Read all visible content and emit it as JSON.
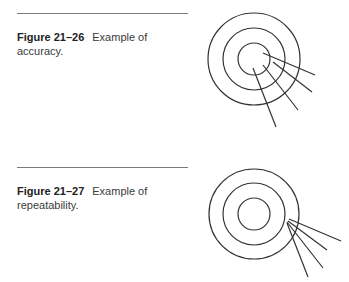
{
  "figures": [
    {
      "number": "Figure 21–26",
      "caption": "Example of accuracy.",
      "illustration": "target-accuracy",
      "target": {
        "cx": 254,
        "cy": 59,
        "radii": [
          46,
          31,
          16
        ]
      },
      "arrows": [
        {
          "x1": 263,
          "y1": 53,
          "x2": 315,
          "y2": 75
        },
        {
          "x1": 273,
          "y1": 62,
          "x2": 312,
          "y2": 92
        },
        {
          "x1": 263,
          "y1": 65,
          "x2": 298,
          "y2": 110
        },
        {
          "x1": 253,
          "y1": 68,
          "x2": 276,
          "y2": 127
        }
      ]
    },
    {
      "number": "Figure 21–27",
      "caption": "Example of repeatability.",
      "illustration": "target-repeatability",
      "target": {
        "cx": 254,
        "cy": 214,
        "radii": [
          45,
          31,
          16
        ]
      },
      "arrows": [
        {
          "x1": 289,
          "y1": 219,
          "x2": 341,
          "y2": 241
        },
        {
          "x1": 288,
          "y1": 221,
          "x2": 327,
          "y2": 250
        },
        {
          "x1": 287,
          "y1": 222,
          "x2": 323,
          "y2": 268
        },
        {
          "x1": 287,
          "y1": 223,
          "x2": 308,
          "y2": 277
        }
      ]
    }
  ],
  "colors": {
    "line": "#333333",
    "rule": "#7a7a7a"
  }
}
